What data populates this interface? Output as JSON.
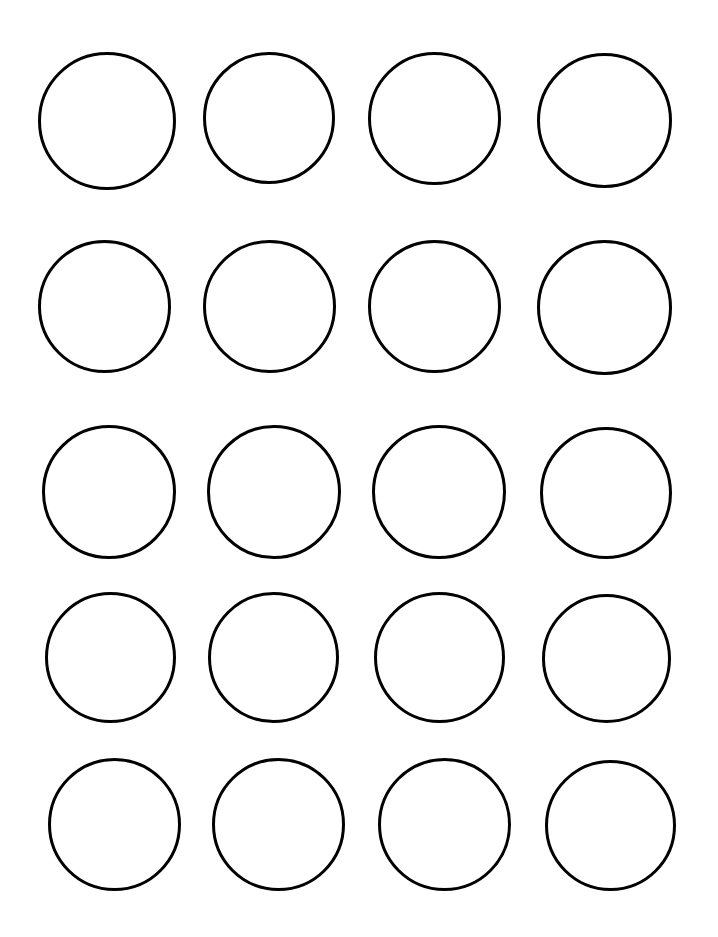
{
  "page": {
    "width": 718,
    "height": 937,
    "background_color": "#ffffff"
  },
  "grid": {
    "rows": 5,
    "columns": 4,
    "total_shapes": 20,
    "shape_type": "circle",
    "column_pitch_px": 166,
    "row_pitch_px": 181
  },
  "style": {
    "stroke_color": "#000000",
    "stroke_width_px": 3,
    "fill_color": "none",
    "fill_label": "transparent"
  },
  "shapes": [
    {
      "id": "circle-r1-c1",
      "row": 1,
      "col": 1,
      "x": 38,
      "y": 52,
      "diameter": 138,
      "label": ""
    },
    {
      "id": "circle-r1-c2",
      "row": 1,
      "col": 2,
      "x": 203,
      "y": 52,
      "diameter": 132,
      "label": ""
    },
    {
      "id": "circle-r1-c3",
      "row": 1,
      "col": 3,
      "x": 368,
      "y": 52,
      "diameter": 133,
      "label": ""
    },
    {
      "id": "circle-r1-c4",
      "row": 1,
      "col": 4,
      "x": 537,
      "y": 53,
      "diameter": 135,
      "label": ""
    },
    {
      "id": "circle-r2-c1",
      "row": 2,
      "col": 1,
      "x": 38,
      "y": 240,
      "diameter": 133,
      "label": ""
    },
    {
      "id": "circle-r2-c2",
      "row": 2,
      "col": 2,
      "x": 203,
      "y": 240,
      "diameter": 133,
      "label": ""
    },
    {
      "id": "circle-r2-c3",
      "row": 2,
      "col": 3,
      "x": 368,
      "y": 240,
      "diameter": 133,
      "label": ""
    },
    {
      "id": "circle-r2-c4",
      "row": 2,
      "col": 4,
      "x": 537,
      "y": 240,
      "diameter": 135,
      "label": ""
    },
    {
      "id": "circle-r3-c1",
      "row": 3,
      "col": 1,
      "x": 42,
      "y": 425,
      "diameter": 134,
      "label": ""
    },
    {
      "id": "circle-r3-c2",
      "row": 3,
      "col": 2,
      "x": 207,
      "y": 425,
      "diameter": 134,
      "label": ""
    },
    {
      "id": "circle-r3-c3",
      "row": 3,
      "col": 3,
      "x": 372,
      "y": 425,
      "diameter": 134,
      "label": ""
    },
    {
      "id": "circle-r3-c4",
      "row": 3,
      "col": 4,
      "x": 540,
      "y": 427,
      "diameter": 132,
      "label": ""
    },
    {
      "id": "circle-r4-c1",
      "row": 4,
      "col": 1,
      "x": 45,
      "y": 592,
      "diameter": 131,
      "label": ""
    },
    {
      "id": "circle-r4-c2",
      "row": 4,
      "col": 2,
      "x": 208,
      "y": 592,
      "diameter": 131,
      "label": ""
    },
    {
      "id": "circle-r4-c3",
      "row": 4,
      "col": 3,
      "x": 374,
      "y": 592,
      "diameter": 131,
      "label": ""
    },
    {
      "id": "circle-r4-c4",
      "row": 4,
      "col": 4,
      "x": 542,
      "y": 594,
      "diameter": 129,
      "label": ""
    },
    {
      "id": "circle-r5-c1",
      "row": 5,
      "col": 1,
      "x": 48,
      "y": 758,
      "diameter": 133,
      "label": ""
    },
    {
      "id": "circle-r5-c2",
      "row": 5,
      "col": 2,
      "x": 212,
      "y": 758,
      "diameter": 133,
      "label": ""
    },
    {
      "id": "circle-r5-c3",
      "row": 5,
      "col": 3,
      "x": 378,
      "y": 758,
      "diameter": 133,
      "label": ""
    },
    {
      "id": "circle-r5-c4",
      "row": 5,
      "col": 4,
      "x": 545,
      "y": 760,
      "diameter": 131,
      "label": ""
    }
  ]
}
